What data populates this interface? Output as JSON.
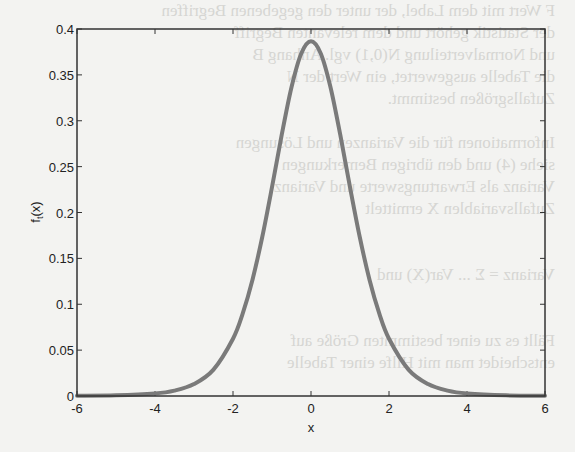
{
  "background_text": [
    "F           Wert mit dem Label, der unter den gegebenen Begriffen",
    "            der Statistik gehört und dem relevanten Begriff",
    "            und Normalverteilung N(0,1) vgl. Anhang B",
    "            die Tabelle ausgewertet, ein Wert der N",
    "            Zufallsgrößen bestimmt.",
    "",
    "            Informationen für die Varianzen und Lösungen",
    "            siehe (4) und den übrigen Bemerkungen",
    "            Varianz als Erwartungswerte und Varianz",
    "            Zufallsvariablen X ermittelt",
    "",
    "",
    "            Varianz = Σ ... Var(X) und",
    "",
    "",
    "            Fällt es zu einer bestimmten Größe auf",
    "            entscheidet man mit Hilfe einer Tabelle"
  ],
  "chart_data": {
    "type": "line",
    "title": "",
    "xlabel": "x",
    "ylabel": "f_t(x)",
    "xlim": [
      -6,
      6
    ],
    "ylim": [
      0,
      0.4
    ],
    "grid": false,
    "legend": null,
    "xticks": [
      -6,
      -4,
      -2,
      0,
      2,
      4,
      6
    ],
    "xtick_labels": [
      "-6",
      "-4",
      "-2",
      "0",
      "2",
      "4",
      "6"
    ],
    "yticks": [
      0,
      0.05,
      0.1,
      0.15,
      0.2,
      0.25,
      0.3,
      0.35,
      0.4
    ],
    "ytick_labels": [
      "0",
      "0.05",
      "0.1",
      "0.15",
      "0.2",
      "0.25",
      "0.3",
      "0.35",
      "0.4"
    ],
    "series": [
      {
        "name": "t-density",
        "color": "#7a7a7a",
        "x": [
          -6,
          -5,
          -4,
          -3.5,
          -3,
          -2.5,
          -2,
          -1.75,
          -1.5,
          -1.25,
          -1,
          -0.75,
          -0.5,
          -0.25,
          0,
          0.25,
          0.5,
          0.75,
          1,
          1.25,
          1.5,
          1.75,
          2,
          2.5,
          3,
          3.5,
          4,
          5,
          6
        ],
        "y": [
          0.0002,
          0.0007,
          0.0028,
          0.0059,
          0.013,
          0.0288,
          0.0624,
          0.09,
          0.1268,
          0.1733,
          0.2276,
          0.2848,
          0.3366,
          0.3734,
          0.3867,
          0.3734,
          0.3366,
          0.2848,
          0.2276,
          0.1733,
          0.1268,
          0.09,
          0.0624,
          0.0288,
          0.013,
          0.0059,
          0.0028,
          0.0007,
          0.0002
        ]
      }
    ]
  },
  "colors": {
    "axis": "#333333",
    "curve": "#7a7a7a",
    "background": "#f3f3f1"
  }
}
